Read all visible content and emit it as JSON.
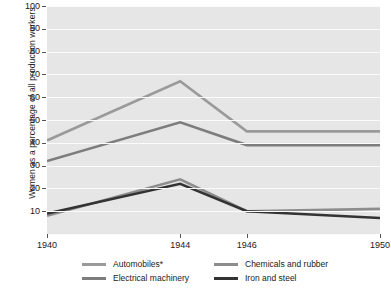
{
  "chart_data": {
    "type": "line",
    "title": "",
    "subtitle": "",
    "xlabel": "",
    "ylabel": "Women as a percentage of all production workers",
    "x": [
      1940,
      1944,
      1946,
      1950
    ],
    "xtick_labels": [
      "1940",
      "1944",
      "1946",
      "1950"
    ],
    "ytick_labels": [
      "10",
      "20",
      "30",
      "40",
      "50",
      "60",
      "70",
      "80",
      "90",
      "100"
    ],
    "ylim": [
      0,
      100
    ],
    "ytick_step": 10,
    "grid": "horizontal-white-gridlines",
    "legend_position": "bottom",
    "series": [
      {
        "name": "Automobiles*",
        "color": "#9a9a9a",
        "values": [
          41,
          67,
          45,
          45
        ]
      },
      {
        "name": "Electrical machinery",
        "color": "#7d7d7d",
        "values": [
          32,
          49,
          39,
          39
        ]
      },
      {
        "name": "Chemicals and rubber",
        "color": "#8d8d8d",
        "values": [
          8,
          24,
          10,
          11
        ]
      },
      {
        "name": "Iron and steel",
        "color": "#333333",
        "values": [
          9,
          22,
          10,
          7
        ]
      }
    ]
  },
  "legend": {
    "items": [
      {
        "label": "Automobiles*"
      },
      {
        "label": "Electrical machinery"
      },
      {
        "label": "Chemicals and rubber"
      },
      {
        "label": "Iron and steel"
      }
    ]
  }
}
